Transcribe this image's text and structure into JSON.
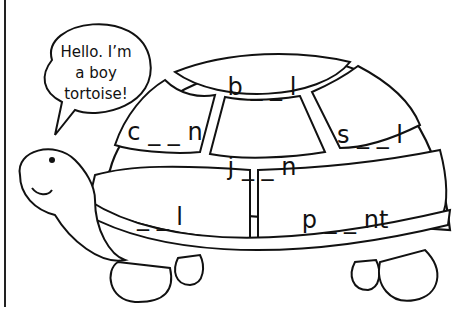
{
  "speech_bubble": {
    "lines": [
      "Hello. I’m",
      "a boy",
      "tortoise!"
    ]
  },
  "shell_segments": [
    {
      "id": "top",
      "text": "b _ _ l"
    },
    {
      "id": "left",
      "text": "c _ _ n"
    },
    {
      "id": "center",
      "text": "j _ _ n"
    },
    {
      "id": "right",
      "text": "s _ _ l"
    },
    {
      "id": "bottom-left",
      "text": "_ _ l"
    },
    {
      "id": "bottom-right",
      "text": "p _ _ nt"
    }
  ],
  "colors": {
    "line": "#111111",
    "background": "#ffffff"
  }
}
